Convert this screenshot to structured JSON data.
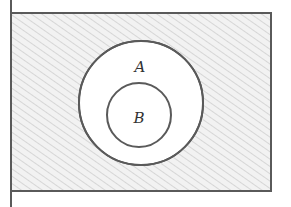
{
  "diagram": {
    "type": "venn",
    "sets": [
      {
        "name": "A",
        "label": "A"
      },
      {
        "name": "B",
        "label": "B",
        "subset_of": "A"
      }
    ],
    "shaded_region": "complement of A",
    "colors": {
      "line": "#5a5a5a",
      "shade": "#d9d9d9",
      "background": "#ffffff"
    }
  }
}
